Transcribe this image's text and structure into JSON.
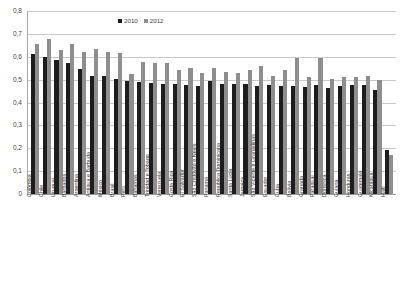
{
  "chart_data": {
    "type": "bar",
    "title": "",
    "subtitle": "",
    "xlabel": "",
    "ylabel": "",
    "ylim": [
      0,
      0.8
    ],
    "y_ticks": [
      "0",
      "0,1",
      "0,2",
      "0,3",
      "0,4",
      "0,5",
      "0,6",
      "0,7",
      "0,8"
    ],
    "y_tick_values": [
      0,
      0.1,
      0.2,
      0.3,
      0.4,
      0.5,
      0.6,
      0.7,
      0.8
    ],
    "grid": true,
    "legend_position": "top-center",
    "decimal_separator": ",",
    "categories": [
      "Colômbia",
      "Chile",
      "Uruguai",
      "Barbados",
      "Argentina",
      "Antígua e Barbuda",
      "México",
      "Brasil",
      "Peru",
      "Bahamas",
      "Trinidad e Tobago",
      "Venezuela",
      "Costa Rica",
      "El Salvador",
      "São Cristóvão e Nevis",
      "Panamá",
      "República Dominicana",
      "Santa Lúcia",
      "Jamaica",
      "São Vicente e Granadinas",
      "Equador",
      "Cuba",
      "Bolívia",
      "Granada",
      "Paraguai",
      "Dominica",
      "Guiana",
      "Honduras",
      "Guatemala",
      "Nicarágua",
      "Haiti"
    ],
    "series": [
      {
        "name": "2010",
        "color": "#1d1d1d",
        "values": [
          0.612,
          0.6,
          0.585,
          0.573,
          0.547,
          0.516,
          0.515,
          0.501,
          0.494,
          0.489,
          0.484,
          0.481,
          0.479,
          0.475,
          0.473,
          0.493,
          0.483,
          0.48,
          0.479,
          0.474,
          0.477,
          0.471,
          0.474,
          0.468,
          0.477,
          0.462,
          0.472,
          0.478,
          0.476,
          0.455,
          0.192
        ]
      },
      {
        "name": "2012",
        "color": "#8e8e8e",
        "values": [
          0.655,
          0.676,
          0.631,
          0.655,
          0.621,
          0.633,
          0.623,
          0.617,
          0.523,
          0.579,
          0.574,
          0.573,
          0.541,
          0.551,
          0.528,
          0.553,
          0.534,
          0.527,
          0.542,
          0.56,
          0.514,
          0.543,
          0.596,
          0.513,
          0.594,
          0.501,
          0.51,
          0.513,
          0.515,
          0.497,
          0.169
        ]
      }
    ]
  },
  "legend": {
    "items": [
      {
        "label": "2010"
      },
      {
        "label": "2012"
      }
    ]
  }
}
